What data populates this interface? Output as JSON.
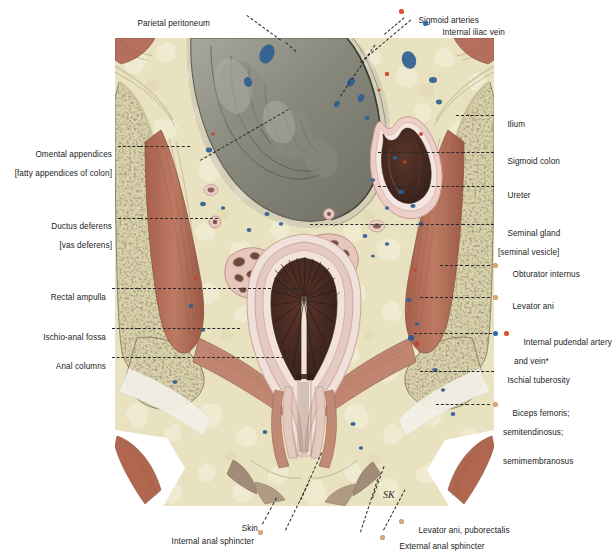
{
  "figure": {
    "artist_mark": "SK"
  },
  "colors": {
    "artery": "#e2502a",
    "vein": "#2a6fb5",
    "muscle_dot": "#d9a877",
    "fat": "#e9e3c4",
    "bone_cortex": "#ddd7b4",
    "bone_marrow": "#6e6046",
    "muscle": "#b4705c",
    "mucosa": "#4b2c24",
    "serosa": "#e7c9c2",
    "peritoneum_sac": "#8d8d84",
    "leader": "#2a2a2a",
    "text": "#1c1c1c"
  },
  "labels": {
    "top": [
      {
        "id": "parietal-peritoneum",
        "text": "Parietal peritoneum",
        "dot": null
      }
    ],
    "top_right": [
      {
        "id": "sigmoid-arteries",
        "text": "Sigmoid arteries",
        "dot": "artery"
      },
      {
        "id": "internal-iliac-vein",
        "text": "Internal iliac vein",
        "dot": "vein"
      }
    ],
    "left": [
      {
        "id": "omental-appendices",
        "text": "Omental appendices",
        "sub": "[fatty appendices of colon]",
        "dot": null
      },
      {
        "id": "ductus-deferens",
        "text": "Ductus deferens",
        "sub": "[vas deferens]",
        "dot": null
      },
      {
        "id": "rectal-ampulla",
        "text": "Rectal ampulla",
        "sub": "",
        "dot": null
      },
      {
        "id": "ischio-anal-fossa",
        "text": "Ischio-anal fossa",
        "sub": "",
        "dot": null
      },
      {
        "id": "anal-columns",
        "text": "Anal columns",
        "sub": "",
        "dot": null
      }
    ],
    "right": [
      {
        "id": "ilium",
        "text": "Ilium",
        "sub": "",
        "dot": null
      },
      {
        "id": "sigmoid-colon",
        "text": "Sigmoid colon",
        "sub": "",
        "dot": null
      },
      {
        "id": "ureter",
        "text": "Ureter",
        "sub": "",
        "dot": null
      },
      {
        "id": "seminal-gland",
        "text": "Seminal gland",
        "sub": "[seminal vesicle]",
        "dot": null
      },
      {
        "id": "obturator-internus",
        "text": "Obturator internus",
        "sub": "",
        "dot": "muscle_dot"
      },
      {
        "id": "levator-ani",
        "text": "Levator ani",
        "sub": "",
        "dot": "muscle_dot"
      },
      {
        "id": "internal-pudendal",
        "text": "Internal pudendal artery",
        "sub": "and vein*",
        "dot": "artery_vein"
      },
      {
        "id": "ischial-tuberosity",
        "text": "Ischial tuberosity",
        "sub": "",
        "dot": null
      },
      {
        "id": "hamstrings",
        "text": "Biceps femoris;",
        "sub": "semitendinosus;",
        "sub2": "semimembranosus",
        "dot": "muscle_dot"
      }
    ],
    "bottom": [
      {
        "id": "skin",
        "text": "Skin",
        "dot": null
      },
      {
        "id": "internal-anal-sphincter",
        "text": "Internal anal sphincter",
        "dot": "muscle_dot"
      },
      {
        "id": "levator-ani-puborectalis",
        "text": "Levator ani, puborectalis",
        "dot": "muscle_dot"
      },
      {
        "id": "external-anal-sphincter",
        "text": "External anal sphincter",
        "dot": "muscle_dot"
      }
    ]
  }
}
